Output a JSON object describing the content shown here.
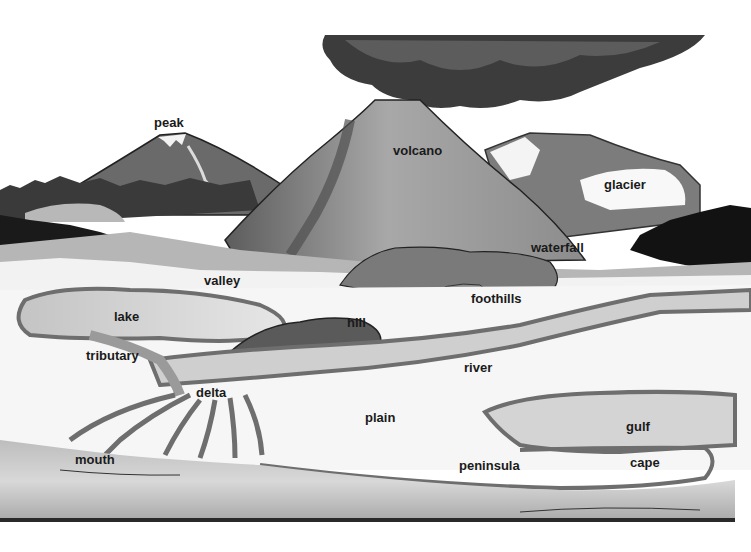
{
  "diagram": {
    "style": "grayscale illustration",
    "colors": {
      "background": "#ffffff",
      "label_text": "#1a1a1a",
      "water_outline": "#6e6e6e",
      "water_fill": "#c8c8c8",
      "mountain_dark": "#6a6a6a",
      "volcano_mid": "#9a9a9a",
      "smoke": "#3c3c3c",
      "forest": "#1c1c1c",
      "land_white": "#f6f6f6"
    },
    "labels": [
      {
        "id": "peak",
        "text": "peak",
        "x": 154,
        "y": 116
      },
      {
        "id": "volcano",
        "text": "volcano",
        "x": 393,
        "y": 144
      },
      {
        "id": "glacier",
        "text": "glacier",
        "x": 604,
        "y": 178
      },
      {
        "id": "waterfall",
        "text": "waterfall",
        "x": 531,
        "y": 241
      },
      {
        "id": "valley",
        "text": "valley",
        "x": 204,
        "y": 274
      },
      {
        "id": "foothills",
        "text": "foothills",
        "x": 471,
        "y": 292
      },
      {
        "id": "lake",
        "text": "lake",
        "x": 114,
        "y": 310
      },
      {
        "id": "hill",
        "text": "hill",
        "x": 347,
        "y": 316
      },
      {
        "id": "tributary",
        "text": "tributary",
        "x": 86,
        "y": 349
      },
      {
        "id": "river",
        "text": "river",
        "x": 464,
        "y": 361
      },
      {
        "id": "delta",
        "text": "delta",
        "x": 196,
        "y": 386
      },
      {
        "id": "plain",
        "text": "plain",
        "x": 365,
        "y": 411
      },
      {
        "id": "gulf",
        "text": "gulf",
        "x": 626,
        "y": 420
      },
      {
        "id": "mouth",
        "text": "mouth",
        "x": 75,
        "y": 453
      },
      {
        "id": "peninsula",
        "text": "peninsula",
        "x": 459,
        "y": 459
      },
      {
        "id": "cape",
        "text": "cape",
        "x": 630,
        "y": 456
      }
    ]
  }
}
